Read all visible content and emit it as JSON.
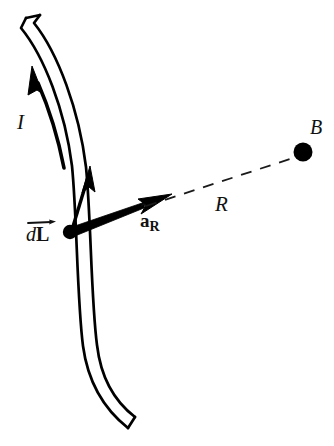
{
  "figure": {
    "background_color": "#ffffff",
    "ink_color": "#000000",
    "width": 334,
    "height": 446
  },
  "labels": {
    "current": "I",
    "distance": "R",
    "field_point": "B",
    "dl_d": "d",
    "dl_L": "L",
    "unit_vector_a": "a",
    "unit_vector_hat": "ˆ",
    "unit_vector_sub": "R"
  },
  "elements": {
    "wire": {
      "name": "current-carrying-wire",
      "description": "curved double-outline tube running from top-left downward and curving right at the bottom",
      "outer_path": "M 26 18 L 22 27 C 45 55 66 110 73 165 C 78 215 78 300 84 345 C 89 382 104 408 128 428",
      "inner_path": "M 40 15 L 34 22 C 58 53 79 110 86 166 C 91 216 91 300 97 344 C 101 378 114 400 134 417",
      "cap_top": "M 26 18 L 40 15",
      "cap_bottom": "M 128 428 L 134 417",
      "stroke_width": 2.6
    },
    "current_arrow": {
      "name": "current-direction-arrow",
      "description": "long slender arrow along the wire pointing upward indicating current I",
      "shaft_path": "M 63 167 C 56 130 46 104 36 82",
      "tip": {
        "x": 33,
        "y": 70
      },
      "head_length": 26,
      "head_width": 15
    },
    "dl_arrow": {
      "name": "dl-element-arrow",
      "description": "short upward arrow at the source point representing the differential length element dL",
      "shaft_path": "M 70 232 L 88 175",
      "tip": {
        "x": 90,
        "y": 168
      },
      "head_length": 22,
      "head_width": 13
    },
    "unit_vector_arrow": {
      "name": "a-r-unit-vector-arrow",
      "description": "thick tapering arrow from the source point toward the field point, the unit vector a-hat sub R",
      "start": {
        "x": 70,
        "y": 232
      },
      "tip": {
        "x": 168,
        "y": 196
      },
      "head_length": 30,
      "head_width": 16
    },
    "source_point": {
      "name": "source-point-dot",
      "description": "filled dot on the wire marking the location of the current element",
      "cx": 70,
      "cy": 232,
      "r": 7
    },
    "field_point": {
      "name": "field-point-dot",
      "description": "filled dot marking the observation point B where the magnetic field is evaluated",
      "cx": 303,
      "cy": 152,
      "r": 9.5
    },
    "distance_line": {
      "name": "distance-dashed-line",
      "description": "thin dashed line of length R from the source point to the field point B",
      "x1": 146,
      "y1": 205,
      "x2": 293,
      "y2": 157,
      "dash": "11 9",
      "stroke_width": 1.7
    }
  }
}
